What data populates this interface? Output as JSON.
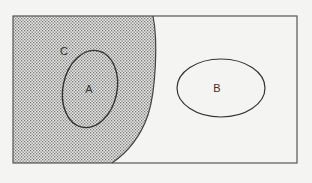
{
  "diagram": {
    "type": "venn-diagram",
    "universe": {
      "shape": "rectangle",
      "x": 13,
      "y": 16,
      "width": 284,
      "height": 147,
      "stroke": "#555555"
    },
    "sets": [
      {
        "name": "C",
        "label": "C",
        "shape": "region-left-curve",
        "shaded": true,
        "fill_pattern": "dotted",
        "label_pos": [
          64,
          55
        ]
      },
      {
        "name": "A",
        "label": "A",
        "shape": "ellipse",
        "cx": 90,
        "cy": 89,
        "rx": 27,
        "ry": 39,
        "rotate": 12,
        "inside": "C",
        "label_pos": [
          89,
          93
        ]
      },
      {
        "name": "B",
        "label": "B",
        "shape": "ellipse",
        "cx": 221,
        "cy": 88,
        "rx": 44,
        "ry": 29,
        "rotate": 0,
        "inside": "universe",
        "label_pos": [
          217,
          92
        ]
      }
    ],
    "colors": {
      "background": "#f4f4f2",
      "stroke": "#444444",
      "dot": "#8a8a8a"
    }
  }
}
